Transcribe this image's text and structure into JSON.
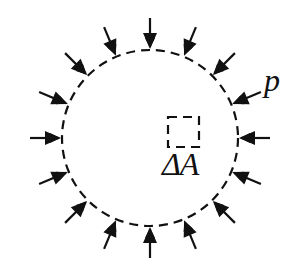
{
  "diagram": {
    "type": "pressure-on-circular-boundary",
    "pressure_label": "p",
    "area_element_label": "ΔA",
    "circle": {
      "cx": 150,
      "cy": 138,
      "r": 88,
      "style": "dashed"
    },
    "arrow_count": 16,
    "arrow_direction": "inward (normal to boundary)",
    "area_element": {
      "x": 168,
      "y": 117,
      "size": 31,
      "style": "dashed"
    },
    "colors": {
      "stroke": "#111111",
      "background": "#ffffff"
    }
  }
}
